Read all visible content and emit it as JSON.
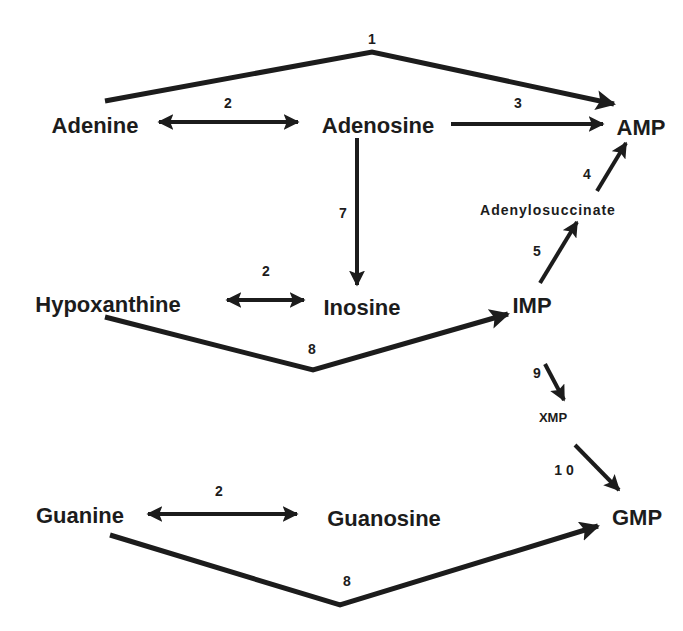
{
  "diagram": {
    "colors": {
      "ink": "#1c1c1c",
      "background": "#ffffff"
    },
    "nodes": [
      {
        "id": "adenine",
        "label": "Adenine",
        "x": 95,
        "y": 133,
        "size": "lg"
      },
      {
        "id": "adenosine",
        "label": "Adenosine",
        "x": 378,
        "y": 133,
        "size": "lg"
      },
      {
        "id": "amp",
        "label": "AMP",
        "x": 641,
        "y": 135,
        "size": "lg"
      },
      {
        "id": "adenylosuccinate",
        "label": "Adenylosuccinate",
        "x": 548,
        "y": 215,
        "size": "sm"
      },
      {
        "id": "hypoxanthine",
        "label": "Hypoxanthine",
        "x": 108,
        "y": 312,
        "size": "lg"
      },
      {
        "id": "inosine",
        "label": "Inosine",
        "x": 362,
        "y": 315,
        "size": "lg"
      },
      {
        "id": "imp",
        "label": "IMP",
        "x": 532,
        "y": 313,
        "size": "lg"
      },
      {
        "id": "xmp",
        "label": "XMP",
        "x": 553,
        "y": 422,
        "size": "xs"
      },
      {
        "id": "guanine",
        "label": "Guanine",
        "x": 80,
        "y": 523,
        "size": "lg"
      },
      {
        "id": "guanosine",
        "label": "Guanosine",
        "x": 384,
        "y": 526,
        "size": "lg"
      },
      {
        "id": "gmp",
        "label": "GMP",
        "x": 637,
        "y": 525,
        "size": "lg"
      }
    ],
    "reactions": [
      {
        "id": "r1",
        "label": "1",
        "x": 372,
        "y": 44,
        "from": "Adenine",
        "to": "AMP"
      },
      {
        "id": "r2a",
        "label": "2",
        "x": 228,
        "y": 110,
        "from": "Adenine",
        "to": "Adenosine",
        "reversible": true
      },
      {
        "id": "r3",
        "label": "3",
        "x": 518,
        "y": 110,
        "from": "Adenosine",
        "to": "AMP"
      },
      {
        "id": "r4",
        "label": "4",
        "x": 587,
        "y": 178,
        "from": "Adenylosuccinate",
        "to": "AMP"
      },
      {
        "id": "r5",
        "label": "5",
        "x": 537,
        "y": 256,
        "from": "IMP",
        "to": "Adenylosuccinate"
      },
      {
        "id": "r7",
        "label": "7",
        "x": 343,
        "y": 218,
        "from": "Adenosine",
        "to": "Inosine"
      },
      {
        "id": "r2b",
        "label": "2",
        "x": 266,
        "y": 276,
        "from": "Hypoxanthine",
        "to": "Inosine",
        "reversible": true
      },
      {
        "id": "r8a",
        "label": "8",
        "x": 312,
        "y": 354,
        "from": "Hypoxanthine",
        "to": "IMP"
      },
      {
        "id": "r9",
        "label": "9",
        "x": 537,
        "y": 378,
        "from": "IMP",
        "to": "XMP"
      },
      {
        "id": "r10",
        "label": "1 0",
        "x": 564,
        "y": 474,
        "from": "XMP",
        "to": "GMP"
      },
      {
        "id": "r2c",
        "label": "2",
        "x": 219,
        "y": 498,
        "from": "Guanine",
        "to": "Guanosine",
        "reversible": true
      },
      {
        "id": "r8b",
        "label": "8",
        "x": 347,
        "y": 586,
        "from": "Guanine",
        "to": "GMP"
      }
    ]
  }
}
